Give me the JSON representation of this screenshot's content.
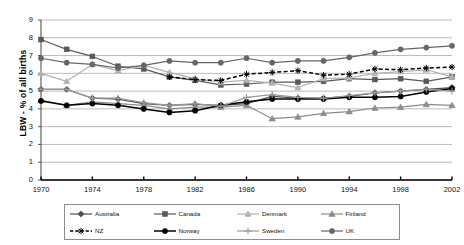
{
  "chart_data": {
    "type": "line",
    "title": "",
    "xlabel": "",
    "ylabel": "LBW - % of all births",
    "xlim": [
      1970,
      2002
    ],
    "ylim": [
      0,
      9
    ],
    "ytick_labels": [
      "0",
      "1",
      "2",
      "3",
      "4",
      "5",
      "6",
      "7",
      "8",
      "9"
    ],
    "xtick_labels": [
      "1970",
      "1974",
      "1978",
      "1982",
      "1986",
      "1990",
      "1994",
      "1998",
      "2002"
    ],
    "grid": "horizontal",
    "legend_position": "bottom",
    "x": [
      1970,
      1972,
      1974,
      1976,
      1978,
      1980,
      1982,
      1984,
      1986,
      1988,
      1990,
      1992,
      1994,
      1996,
      1998,
      2000,
      2002
    ],
    "series": [
      {
        "name": "Australia",
        "color": "#4d4d4d",
        "marker": "diamond",
        "dash": "solid",
        "values": [
          5.1,
          5.1,
          4.6,
          4.55,
          4.3,
          4.2,
          4.25,
          4.2,
          4.3,
          4.7,
          4.6,
          4.6,
          4.7,
          4.9,
          5.0,
          5.1,
          5.2
        ]
      },
      {
        "name": "Canada",
        "color": "#595959",
        "marker": "square",
        "dash": "solid",
        "values": [
          7.9,
          7.35,
          6.95,
          6.4,
          6.25,
          5.8,
          5.6,
          5.35,
          5.4,
          5.5,
          5.5,
          5.55,
          5.7,
          5.65,
          5.7,
          5.55,
          5.8
        ]
      },
      {
        "name": "Denmark",
        "color": "#b3b3b3",
        "marker": "triangle",
        "dash": "solid",
        "values": [
          6.0,
          5.55,
          6.5,
          6.15,
          6.45,
          6.05,
          5.7,
          5.5,
          5.6,
          5.45,
          5.2,
          5.7,
          5.75,
          6.0,
          6.1,
          6.2,
          5.8
        ]
      },
      {
        "name": "Finland",
        "color": "#8c8c8c",
        "marker": "triangle",
        "dash": "solid",
        "values": [
          4.5,
          4.2,
          4.4,
          4.3,
          4.2,
          4.0,
          4.1,
          4.1,
          4.2,
          3.45,
          3.55,
          3.75,
          3.85,
          4.05,
          4.1,
          4.25,
          4.2
        ]
      },
      {
        "name": "NZ",
        "color": "#000000",
        "marker": "star",
        "dash": "dashed",
        "values": [
          null,
          null,
          null,
          null,
          null,
          5.8,
          5.65,
          5.6,
          5.95,
          6.05,
          6.15,
          5.9,
          5.95,
          6.25,
          6.2,
          6.3,
          6.35
        ]
      },
      {
        "name": "Norway",
        "color": "#000000",
        "marker": "circle",
        "dash": "solid",
        "values": [
          4.45,
          4.2,
          4.3,
          4.2,
          4.0,
          3.8,
          3.9,
          4.2,
          4.4,
          4.55,
          4.55,
          4.55,
          4.65,
          4.65,
          4.7,
          4.95,
          5.15
        ]
      },
      {
        "name": "Sweden",
        "color": "#999999",
        "marker": "plus",
        "dash": "solid",
        "values": [
          5.1,
          5.1,
          4.6,
          4.6,
          4.35,
          4.2,
          4.3,
          4.15,
          4.65,
          4.8,
          4.65,
          4.6,
          4.75,
          4.9,
          5.0,
          5.1,
          5.0
        ]
      },
      {
        "name": "UK",
        "color": "#666666",
        "marker": "circle",
        "dash": "solid",
        "values": [
          6.85,
          6.6,
          6.5,
          6.3,
          6.45,
          6.7,
          6.6,
          6.6,
          6.85,
          6.6,
          6.7,
          6.7,
          6.9,
          7.15,
          7.35,
          7.45,
          7.55
        ]
      }
    ]
  }
}
